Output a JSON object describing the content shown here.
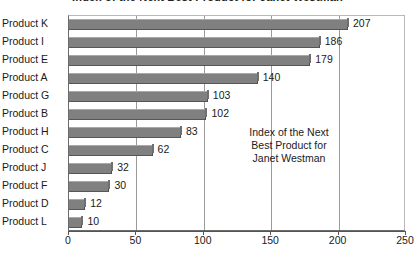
{
  "chart_data": {
    "type": "bar",
    "orientation": "horizontal",
    "title": "Index of the Next Best Product for Janet Westman",
    "xlabel": "",
    "ylabel": "",
    "xlim": [
      0,
      250
    ],
    "xticks": [
      0,
      50,
      100,
      150,
      200,
      250
    ],
    "grid": true,
    "legend": "none",
    "categories": [
      "Product K",
      "Product I",
      "Product E",
      "Product A",
      "Product G",
      "Product B",
      "Product H",
      "Product C",
      "Product J",
      "Product F",
      "Product D",
      "Product L"
    ],
    "values": [
      207,
      186,
      179,
      140,
      103,
      102,
      83,
      62,
      32,
      30,
      12,
      10
    ],
    "value_labels": [
      "207",
      "186",
      "179",
      "140",
      "103",
      "102",
      "83",
      "62",
      "32",
      "30",
      "12",
      "10"
    ],
    "annotation": {
      "line1": "Index of the Next",
      "line2": "Best Product for",
      "line3": "Janet Westman"
    },
    "colors": {
      "bar_fill": "#808080",
      "bar_shadow": "#565656",
      "bar_highlight": "#a8a8a8",
      "plot_background": "#ffffff",
      "gridline": "#9a9a9a",
      "axis": "#555555",
      "text": "#1a1a1a"
    }
  }
}
